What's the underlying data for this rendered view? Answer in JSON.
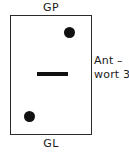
{
  "figure": {
    "type": "schematic-diagram",
    "background_color": "#ffffff",
    "stroke_color": "#2b2b2b",
    "fill_color": "#111111"
  },
  "labels": {
    "top_terminal": "GP",
    "bottom_terminal": "GL"
  },
  "annotation": {
    "line1": "Ant –",
    "line2": "wort 3",
    "full_text": "Antwort 3"
  },
  "elements": {
    "body_rect_name": "device-body-rectangle",
    "center_bar_name": "center-contact-bar",
    "dot_top_right_name": "contact-dot-top-right",
    "dot_bottom_left_name": "contact-dot-bottom-left"
  }
}
